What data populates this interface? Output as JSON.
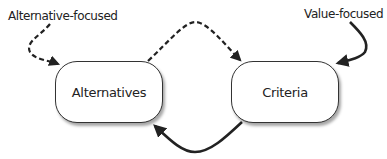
{
  "diagram": {
    "nodes": [
      {
        "id": "alternatives",
        "label": "Alternatives"
      },
      {
        "id": "criteria",
        "label": "Criteria"
      }
    ],
    "annotations": {
      "alternative_focused": "Alternative-focused",
      "value_focused": "Value-focused"
    },
    "edges": [
      {
        "from": "alternative_focused",
        "to": "alternatives",
        "style": "dashed"
      },
      {
        "from": "alternatives",
        "to": "criteria",
        "style": "dashed"
      },
      {
        "from": "value_focused",
        "to": "criteria",
        "style": "solid"
      },
      {
        "from": "criteria",
        "to": "alternatives",
        "style": "solid"
      }
    ]
  }
}
